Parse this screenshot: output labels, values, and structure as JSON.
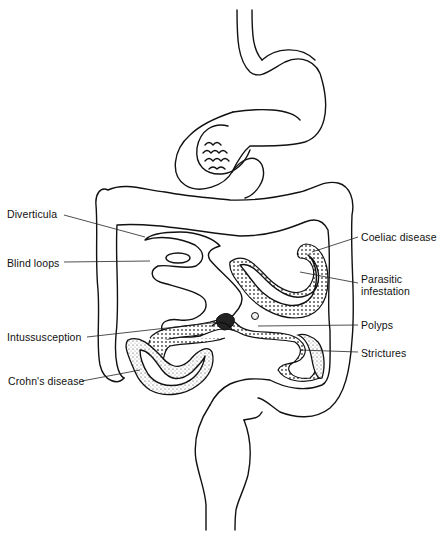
{
  "diagram": {
    "labels_left": [
      {
        "id": "diverticula",
        "text": "Diverticula",
        "x": 7,
        "y": 208
      },
      {
        "id": "blind-loops",
        "text": "Blind loops",
        "x": 7,
        "y": 257
      },
      {
        "id": "intussusception",
        "text": "Intussusception",
        "x": 7,
        "y": 331
      },
      {
        "id": "crohns-disease",
        "text": "Crohn's disease",
        "x": 8,
        "y": 375
      }
    ],
    "labels_right": [
      {
        "id": "coeliac-disease",
        "text": "Coeliac disease",
        "x": 361,
        "y": 231
      },
      {
        "id": "parasitic-infestation",
        "text": "Parasitic\ninfestation",
        "line1": "Parasitic",
        "line2": "infestation",
        "x": 361,
        "y": 273
      },
      {
        "id": "polyps",
        "text": "Polyps",
        "x": 361,
        "y": 319
      },
      {
        "id": "strictures",
        "text": "Strictures",
        "x": 361,
        "y": 347
      }
    ]
  }
}
